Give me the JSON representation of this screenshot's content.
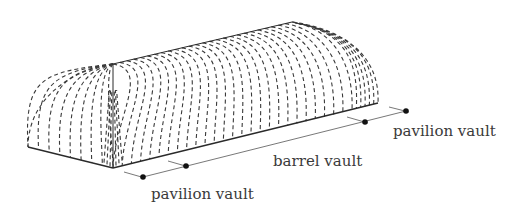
{
  "diagram": {
    "labels": {
      "left_segment": "pavilion vault",
      "middle_segment": "barrel vault",
      "right_segment": "pavilion vault"
    },
    "colors": {
      "line": "#2a2a2a",
      "dash": "#3a3a3a",
      "text": "#3a3a3a",
      "background": "#ffffff"
    },
    "barrel_rib_count": 26,
    "pavilion_rib_count": 8
  }
}
